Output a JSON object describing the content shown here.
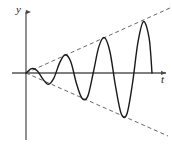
{
  "figure": {
    "axes": {
      "y_axis_label": "y",
      "t_axis_label": "t",
      "origin_px": [
        26,
        73
      ],
      "y_axis_top_px": [
        26,
        10
      ],
      "y_axis_bottom_px": [
        26,
        140
      ],
      "t_axis_right_px": [
        168,
        73
      ],
      "axis_color": "#4a4a4a",
      "arrowheads": [
        "y-axis-top",
        "t-axis-right"
      ]
    },
    "curve": {
      "name": "growing-sinusoid",
      "color": "#1a1a1a",
      "stroke_width": 1.4,
      "description": "Sinusoid of constant period whose amplitude grows linearly from zero at the origin",
      "start_px": [
        26,
        73
      ],
      "end_px": [
        152,
        73
      ],
      "zero_crossings_px_x": [
        26,
        42,
        53,
        66,
        78,
        90,
        103,
        117,
        130,
        143,
        152
      ],
      "peaks_px": [
        [
          36,
          68
        ],
        [
          60,
          50
        ],
        [
          85,
          36
        ],
        [
          110,
          27
        ],
        [
          136,
          72
        ]
      ],
      "troughs_px": [
        [
          47,
          85
        ],
        [
          72,
          98
        ],
        [
          97,
          111
        ],
        [
          123,
          124
        ]
      ]
    },
    "envelope": {
      "name": "linear-envelope",
      "style": "dashed",
      "color": "#555555",
      "stroke_width": 1,
      "dash_pattern": "4 3",
      "upper_line_px": [
        [
          26,
          73
        ],
        [
          170,
          8
        ]
      ],
      "lower_line_px": [
        [
          26,
          73
        ],
        [
          168,
          136
        ]
      ],
      "slope_upper": -0.45,
      "slope_lower": 0.44
    }
  },
  "chart_data": {
    "type": "line",
    "xlabel": "t",
    "ylabel": "y",
    "grid": false,
    "legend_position": "none",
    "xlim": [
      0,
      10
    ],
    "ylim": [
      -5,
      5
    ],
    "annotations": [
      "Upper dashed envelope: y = +k t",
      "Lower dashed envelope: y = -k t"
    ],
    "series": [
      {
        "name": "growing-sinusoid",
        "style": "solid",
        "color": "#1a1a1a",
        "x": [
          0.0,
          0.4,
          0.8,
          1.2,
          1.6,
          2.0,
          2.4,
          2.8,
          3.2,
          3.6,
          4.0,
          4.4,
          4.8,
          5.2,
          5.6,
          6.0,
          6.4,
          6.8,
          7.2,
          7.6,
          8.0,
          8.4,
          8.8,
          9.0
        ],
        "values": [
          0.0,
          0.32,
          0.17,
          -0.43,
          -0.82,
          -0.35,
          0.74,
          1.33,
          0.82,
          -0.75,
          -1.84,
          -1.72,
          0.0,
          1.9,
          2.57,
          1.53,
          -1.0,
          -2.96,
          -3.0,
          -0.8,
          2.26,
          3.75,
          2.5,
          0.0
        ]
      },
      {
        "name": "upper-envelope",
        "style": "dashed",
        "color": "#555555",
        "x": [
          0,
          10
        ],
        "values": [
          0,
          4.6
        ]
      },
      {
        "name": "lower-envelope",
        "style": "dashed",
        "color": "#555555",
        "x": [
          0,
          10
        ],
        "values": [
          0,
          -4.5
        ]
      }
    ]
  }
}
